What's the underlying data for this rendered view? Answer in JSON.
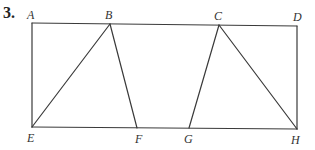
{
  "problem": {
    "number": "3."
  },
  "colors": {
    "line": "#3a3a3a",
    "text": "#333333",
    "background": "#ffffff"
  },
  "points": {
    "A": {
      "label": "A",
      "x": 32,
      "y": 23
    },
    "B": {
      "label": "B",
      "x": 110,
      "y": 24
    },
    "C": {
      "label": "C",
      "x": 219,
      "y": 25
    },
    "D": {
      "label": "D",
      "x": 297,
      "y": 26
    },
    "E": {
      "label": "E",
      "x": 32,
      "y": 127
    },
    "F": {
      "label": "F",
      "x": 137,
      "y": 128
    },
    "G": {
      "label": "G",
      "x": 189,
      "y": 128
    },
    "H": {
      "label": "H",
      "x": 297,
      "y": 129
    }
  },
  "segments": [
    [
      "A",
      "D"
    ],
    [
      "D",
      "H"
    ],
    [
      "H",
      "E"
    ],
    [
      "E",
      "A"
    ],
    [
      "E",
      "B"
    ],
    [
      "B",
      "F"
    ],
    [
      "G",
      "C"
    ],
    [
      "C",
      "H"
    ]
  ]
}
